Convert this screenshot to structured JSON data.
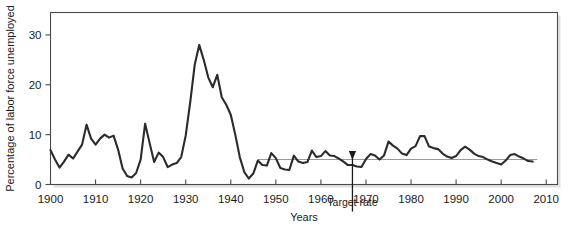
{
  "figure": {
    "background_color": "#ffffff",
    "frame_color": "#4a4a4a",
    "shadow_color": "#c9c9c9"
  },
  "annotations": {
    "target_rate_label": "Target rate",
    "target_rate_value": 5.0,
    "arrow_year": 1967
  },
  "chart_data": {
    "type": "line",
    "title": "",
    "xlabel": "Years",
    "ylabel": "Percentage of labor force unemployed",
    "xlim": [
      1900,
      2012.5
    ],
    "ylim": [
      0,
      34.5
    ],
    "grid": false,
    "legend": null,
    "xticks": [
      1900,
      1910,
      1920,
      1930,
      1940,
      1950,
      1960,
      1970,
      1980,
      1990,
      2000,
      2010
    ],
    "xtick_labels": [
      "1900",
      "1910",
      "1920",
      "1930",
      "1940",
      "1950",
      "1960",
      "1970",
      "1980",
      "1990",
      "2000",
      "2010"
    ],
    "yticks": [
      0,
      10,
      20,
      30
    ],
    "ytick_labels": [
      "0",
      "10",
      "20",
      "30"
    ],
    "series": [
      {
        "name": "Unemployment rate",
        "color": "#2b2b2b",
        "width": 2.1,
        "x": [
          1900,
          1901,
          1902,
          1903,
          1904,
          1905,
          1906,
          1907,
          1908,
          1909,
          1910,
          1911,
          1912,
          1913,
          1914,
          1915,
          1916,
          1917,
          1918,
          1919,
          1920,
          1921,
          1922,
          1923,
          1924,
          1925,
          1926,
          1927,
          1928,
          1929,
          1930,
          1931,
          1932,
          1933,
          1934,
          1935,
          1936,
          1937,
          1938,
          1939,
          1940,
          1941,
          1942,
          1943,
          1944,
          1945,
          1946,
          1947,
          1948,
          1949,
          1950,
          1951,
          1952,
          1953,
          1954,
          1955,
          1956,
          1957,
          1958,
          1959,
          1960,
          1961,
          1962,
          1963,
          1964,
          1965,
          1966,
          1967,
          1968,
          1969,
          1970,
          1971,
          1972,
          1973,
          1974,
          1975,
          1976,
          1977,
          1978,
          1979,
          1980,
          1981,
          1982,
          1983,
          1984,
          1985,
          1986,
          1987,
          1988,
          1989,
          1990,
          1991,
          1992,
          1993,
          1994,
          1995,
          1996,
          1997,
          1998,
          1999,
          2000,
          2001,
          2002,
          2003,
          2004,
          2005,
          2006,
          2007
        ],
        "y": [
          6.9,
          5.0,
          3.4,
          4.6,
          6.0,
          5.2,
          6.6,
          8.0,
          12.0,
          9.2,
          8.0,
          9.2,
          10.0,
          9.4,
          9.8,
          7.0,
          3.2,
          1.7,
          1.4,
          2.3,
          5.0,
          12.2,
          8.3,
          4.5,
          6.4,
          5.5,
          3.5,
          4.0,
          4.3,
          5.5,
          9.8,
          16.5,
          24.0,
          28.0,
          25.0,
          21.5,
          19.5,
          22.0,
          17.5,
          16.0,
          14.0,
          10.0,
          5.5,
          2.5,
          1.2,
          2.2,
          4.8,
          3.9,
          3.8,
          6.3,
          5.3,
          3.3,
          3.0,
          2.9,
          5.8,
          4.6,
          4.3,
          4.5,
          6.8,
          5.5,
          5.7,
          6.7,
          5.8,
          5.7,
          5.2,
          4.6,
          3.9,
          3.9,
          3.6,
          3.5,
          5.1,
          6.1,
          5.8,
          5.0,
          5.8,
          8.6,
          7.8,
          7.2,
          6.2,
          5.9,
          7.2,
          7.7,
          9.7,
          9.7,
          7.6,
          7.3,
          7.1,
          6.2,
          5.6,
          5.3,
          5.7,
          6.9,
          7.6,
          7.0,
          6.2,
          5.7,
          5.5,
          5.0,
          4.6,
          4.3,
          4.0,
          4.8,
          5.9,
          6.1,
          5.6,
          5.2,
          4.7,
          4.6
        ]
      }
    ],
    "reference_line": {
      "name": "Target rate line",
      "value": 5.0,
      "x_start": 1946,
      "x_end": 2008,
      "color": "#9a9a9a",
      "width": 1.1
    }
  }
}
